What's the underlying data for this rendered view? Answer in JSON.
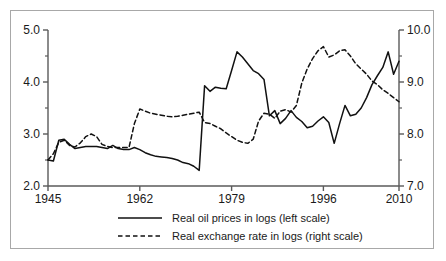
{
  "chart_data": {
    "type": "line",
    "title": "",
    "subtitle": "",
    "xlabel": "",
    "ylabel": "",
    "grid": false,
    "legend_position": "bottom",
    "x": [
      1945,
      1946,
      1947,
      1948,
      1949,
      1950,
      1951,
      1952,
      1953,
      1954,
      1955,
      1956,
      1957,
      1958,
      1959,
      1960,
      1961,
      1962,
      1963,
      1964,
      1965,
      1966,
      1967,
      1968,
      1969,
      1970,
      1971,
      1972,
      1973,
      1974,
      1975,
      1976,
      1977,
      1978,
      1979,
      1980,
      1981,
      1982,
      1983,
      1984,
      1985,
      1986,
      1987,
      1988,
      1989,
      1990,
      1991,
      1992,
      1993,
      1994,
      1995,
      1996,
      1997,
      1998,
      1999,
      2000,
      2001,
      2002,
      2003,
      2004,
      2005,
      2006,
      2007,
      2008,
      2009,
      2010
    ],
    "xlim": [
      1945,
      2010
    ],
    "xticks": [
      1945,
      1962,
      1979,
      1996,
      2010
    ],
    "xticklabels": [
      "1945",
      "1962",
      "1979",
      "1996",
      "2010"
    ],
    "left_axis": {
      "label": "Real oil prices in logs (left scale)",
      "ylim": [
        2.0,
        5.0
      ],
      "yticks": [
        2.0,
        3.0,
        4.0,
        5.0
      ],
      "yticklabels": [
        "2.0",
        "3.0",
        "4.0",
        "5.0"
      ],
      "minor_yticks": [
        2.5,
        3.5,
        4.5
      ]
    },
    "right_axis": {
      "label": "Real exchange rate in logs (right scale)",
      "ylim": [
        7.0,
        10.0
      ],
      "yticks": [
        7.0,
        8.0,
        9.0,
        10.0
      ],
      "yticklabels": [
        "7.0",
        "8.0",
        "9.0",
        "10.0"
      ],
      "minor_yticks": [
        7.5,
        8.5,
        9.5
      ]
    },
    "series": [
      {
        "name": "Real oil prices in logs (left scale)",
        "axis": "left",
        "style": "solid",
        "color": "#111111",
        "values": [
          2.5,
          2.48,
          2.88,
          2.9,
          2.8,
          2.72,
          2.74,
          2.76,
          2.76,
          2.76,
          2.74,
          2.72,
          2.78,
          2.72,
          2.7,
          2.7,
          2.74,
          2.7,
          2.64,
          2.6,
          2.57,
          2.56,
          2.55,
          2.53,
          2.5,
          2.45,
          2.43,
          2.38,
          2.3,
          3.93,
          3.82,
          3.9,
          3.88,
          3.87,
          4.22,
          4.58,
          4.48,
          4.35,
          4.22,
          4.16,
          4.05,
          3.35,
          3.45,
          3.2,
          3.3,
          3.45,
          3.32,
          3.24,
          3.12,
          3.15,
          3.25,
          3.33,
          3.22,
          2.82,
          3.2,
          3.55,
          3.35,
          3.38,
          3.5,
          3.7,
          3.95,
          4.12,
          4.28,
          4.58,
          4.15,
          4.4
        ],
        "notable_points": [
          {
            "x": 1973,
            "y": 2.3,
            "note": "pre-shock low"
          },
          {
            "x": 1974,
            "y": 3.93,
            "note": "first oil shock"
          },
          {
            "x": 1980,
            "y": 4.58,
            "note": "second oil shock peak"
          },
          {
            "x": 1986,
            "y": 3.35,
            "note": "oil price collapse"
          },
          {
            "x": 1998,
            "y": 2.82,
            "note": "Asian crisis low"
          },
          {
            "x": 2008,
            "y": 4.58,
            "note": "2008 peak"
          },
          {
            "x": 2009,
            "y": 4.15,
            "note": "crisis drop"
          },
          {
            "x": 2010,
            "y": 4.4,
            "note": "recovery"
          }
        ]
      },
      {
        "name": "Real exchange rate in logs (right scale)",
        "axis": "right",
        "style": "dashed",
        "color": "#111111",
        "values": [
          7.5,
          7.62,
          7.84,
          7.88,
          7.78,
          7.75,
          7.83,
          7.95,
          8.0,
          7.95,
          7.8,
          7.76,
          7.74,
          7.74,
          7.74,
          7.74,
          8.2,
          8.48,
          8.44,
          8.4,
          8.38,
          8.36,
          8.34,
          8.33,
          8.34,
          8.36,
          8.38,
          8.4,
          8.42,
          8.22,
          8.2,
          8.15,
          8.1,
          8.02,
          7.95,
          7.88,
          7.84,
          7.82,
          7.9,
          8.25,
          8.4,
          8.38,
          8.3,
          8.44,
          8.47,
          8.42,
          8.55,
          8.98,
          9.25,
          9.45,
          9.6,
          9.68,
          9.48,
          9.52,
          9.6,
          9.62,
          9.5,
          9.35,
          9.25,
          9.15,
          9.02,
          8.95,
          8.85,
          8.78,
          8.7,
          8.62
        ],
        "notable_points": [
          {
            "x": 1960,
            "y": 7.74,
            "note": "pre-jump plateau"
          },
          {
            "x": 1962,
            "y": 8.48,
            "note": "step up"
          },
          {
            "x": 1982,
            "y": 7.82,
            "note": "trough"
          },
          {
            "x": 1996,
            "y": 9.68,
            "note": "peak"
          },
          {
            "x": 2010,
            "y": 8.62,
            "note": "decline"
          }
        ]
      }
    ]
  },
  "legend": {
    "items": [
      {
        "label": "Real oil prices in logs (left scale)",
        "style": "solid"
      },
      {
        "label": "Real exchange rate in logs (right scale)",
        "style": "dashed"
      }
    ]
  },
  "colors": {
    "line": "#111111",
    "axis": "#5a5a5a",
    "frame": "#a8a8a8",
    "text": "#1a1a1a",
    "background": "#ffffff"
  }
}
